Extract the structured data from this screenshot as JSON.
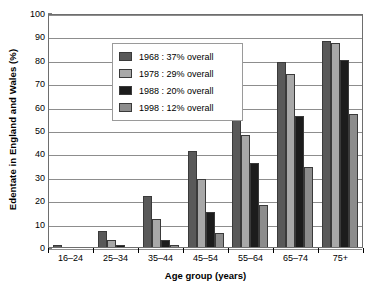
{
  "chart_data": {
    "type": "bar",
    "title": "",
    "xlabel": "Age group (years)",
    "ylabel": "Edentate in England and Wales (%)",
    "ylim": [
      0,
      100
    ],
    "ytick_step": 10,
    "yticks": [
      "100",
      "90",
      "80",
      "70",
      "60",
      "50",
      "40",
      "30",
      "20",
      "10",
      "0"
    ],
    "grid": true,
    "legend_position": "upper-left-inside",
    "categories": [
      "16–24",
      "25–34",
      "35–44",
      "45–54",
      "55–64",
      "65–74",
      "75+"
    ],
    "series": [
      {
        "name": "1968 : 37% overall",
        "year": "1968",
        "overall": "37% overall",
        "color": "#595959",
        "values": [
          1,
          7,
          22,
          41,
          64,
          79,
          88
        ]
      },
      {
        "name": "1978 : 29% overall",
        "year": "1978",
        "overall": "29% overall",
        "color": "#a8a8a8",
        "values": [
          0,
          3,
          12,
          29,
          48,
          74,
          87
        ]
      },
      {
        "name": "1988 : 20% overall",
        "year": "1988",
        "overall": "20% overall",
        "color": "#1c1c1c",
        "values": [
          0,
          1,
          3,
          15,
          36,
          56,
          80
        ]
      },
      {
        "name": "1998 : 12% overall",
        "year": "1998",
        "overall": "12% overall",
        "color": "#8c8c8c",
        "values": [
          0,
          0,
          1,
          6,
          18,
          34,
          57
        ]
      }
    ]
  },
  "legend": {
    "items": [
      {
        "label": "1968 : 37% overall",
        "color": "#595959"
      },
      {
        "label": "1978 : 29% overall",
        "color": "#a8a8a8"
      },
      {
        "label": "1988 : 20% overall",
        "color": "#1c1c1c"
      },
      {
        "label": "1998 : 12% overall",
        "color": "#8c8c8c"
      }
    ]
  },
  "axes": {
    "y_title": "Edentate in England and Wales (%)",
    "x_title": "Age group (years)"
  }
}
